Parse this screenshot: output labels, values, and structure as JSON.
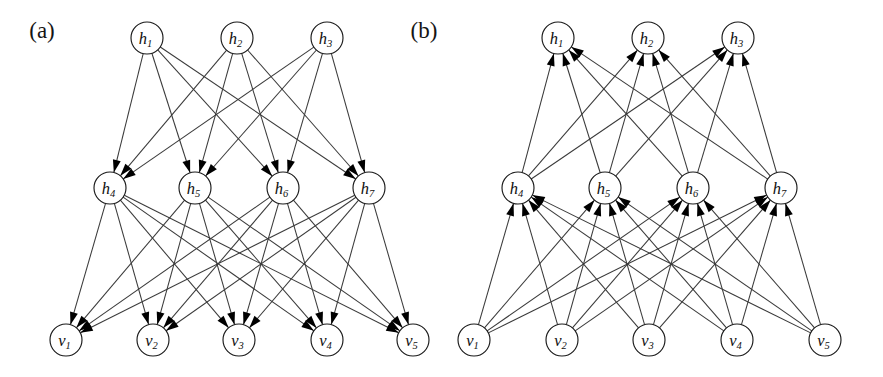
{
  "figure": {
    "width": 883,
    "height": 377,
    "background": "#ffffff",
    "edge_color": "#3a3a3a",
    "node_stroke": "#1a1a1a",
    "node_fill": "#ffffff",
    "arrow_color": "#000000",
    "node_radius": 16
  },
  "panels": [
    {
      "id": "panel-a",
      "label": "(a)",
      "label_x": 42,
      "label_y": 38,
      "direction": "downward",
      "layers": [
        {
          "name": "top-hidden",
          "y": 38,
          "nodes": [
            {
              "id": "h1",
              "base": "h",
              "sub": "1",
              "x": 147
            },
            {
              "id": "h2",
              "base": "h",
              "sub": "2",
              "x": 237
            },
            {
              "id": "h3",
              "base": "h",
              "sub": "3",
              "x": 327
            }
          ]
        },
        {
          "name": "mid-hidden",
          "y": 188,
          "nodes": [
            {
              "id": "h4",
              "base": "h",
              "sub": "4",
              "x": 110
            },
            {
              "id": "h5",
              "base": "h",
              "sub": "5",
              "x": 195
            },
            {
              "id": "h6",
              "base": "h",
              "sub": "6",
              "x": 283
            },
            {
              "id": "h7",
              "base": "h",
              "sub": "7",
              "x": 369
            }
          ]
        },
        {
          "name": "visible",
          "y": 340,
          "nodes": [
            {
              "id": "v1",
              "base": "v",
              "sub": "1",
              "x": 66
            },
            {
              "id": "v2",
              "base": "v",
              "sub": "2",
              "x": 153
            },
            {
              "id": "v3",
              "base": "v",
              "sub": "3",
              "x": 239
            },
            {
              "id": "v4",
              "base": "v",
              "sub": "4",
              "x": 327
            },
            {
              "id": "v5",
              "base": "v",
              "sub": "5",
              "x": 413
            }
          ]
        }
      ],
      "edges": [
        {
          "from": "h1",
          "to": "h4"
        },
        {
          "from": "h1",
          "to": "h5"
        },
        {
          "from": "h1",
          "to": "h6"
        },
        {
          "from": "h1",
          "to": "h7"
        },
        {
          "from": "h2",
          "to": "h4"
        },
        {
          "from": "h2",
          "to": "h5"
        },
        {
          "from": "h2",
          "to": "h6"
        },
        {
          "from": "h2",
          "to": "h7"
        },
        {
          "from": "h3",
          "to": "h4"
        },
        {
          "from": "h3",
          "to": "h5"
        },
        {
          "from": "h3",
          "to": "h6"
        },
        {
          "from": "h3",
          "to": "h7"
        },
        {
          "from": "h4",
          "to": "v1"
        },
        {
          "from": "h4",
          "to": "v2"
        },
        {
          "from": "h4",
          "to": "v3"
        },
        {
          "from": "h4",
          "to": "v4"
        },
        {
          "from": "h4",
          "to": "v5"
        },
        {
          "from": "h5",
          "to": "v1"
        },
        {
          "from": "h5",
          "to": "v2"
        },
        {
          "from": "h5",
          "to": "v3"
        },
        {
          "from": "h5",
          "to": "v4"
        },
        {
          "from": "h5",
          "to": "v5"
        },
        {
          "from": "h6",
          "to": "v1"
        },
        {
          "from": "h6",
          "to": "v2"
        },
        {
          "from": "h6",
          "to": "v3"
        },
        {
          "from": "h6",
          "to": "v4"
        },
        {
          "from": "h6",
          "to": "v5"
        },
        {
          "from": "h7",
          "to": "v1"
        },
        {
          "from": "h7",
          "to": "v2"
        },
        {
          "from": "h7",
          "to": "v3"
        },
        {
          "from": "h7",
          "to": "v4"
        },
        {
          "from": "h7",
          "to": "v5"
        }
      ]
    },
    {
      "id": "panel-b",
      "label": "(b)",
      "label_x": 424,
      "label_y": 38,
      "direction": "upward",
      "layers": [
        {
          "name": "top-hidden",
          "y": 38,
          "nodes": [
            {
              "id": "h1",
              "base": "h",
              "sub": "1",
              "x": 558
            },
            {
              "id": "h2",
              "base": "h",
              "sub": "2",
              "x": 648
            },
            {
              "id": "h3",
              "base": "h",
              "sub": "3",
              "x": 738
            }
          ]
        },
        {
          "name": "mid-hidden",
          "y": 188,
          "nodes": [
            {
              "id": "h4",
              "base": "h",
              "sub": "4",
              "x": 518
            },
            {
              "id": "h5",
              "base": "h",
              "sub": "5",
              "x": 605
            },
            {
              "id": "h6",
              "base": "h",
              "sub": "6",
              "x": 693
            },
            {
              "id": "h7",
              "base": "h",
              "sub": "7",
              "x": 781
            }
          ]
        },
        {
          "name": "visible",
          "y": 340,
          "nodes": [
            {
              "id": "v1",
              "base": "v",
              "sub": "1",
              "x": 474
            },
            {
              "id": "v2",
              "base": "v",
              "sub": "2",
              "x": 562
            },
            {
              "id": "v3",
              "base": "v",
              "sub": "3",
              "x": 649
            },
            {
              "id": "v4",
              "base": "v",
              "sub": "4",
              "x": 737
            },
            {
              "id": "v5",
              "base": "v",
              "sub": "5",
              "x": 825
            }
          ]
        }
      ],
      "edges": [
        {
          "from": "v1",
          "to": "h4"
        },
        {
          "from": "v1",
          "to": "h5"
        },
        {
          "from": "v1",
          "to": "h6"
        },
        {
          "from": "v1",
          "to": "h7"
        },
        {
          "from": "v2",
          "to": "h4"
        },
        {
          "from": "v2",
          "to": "h5"
        },
        {
          "from": "v2",
          "to": "h6"
        },
        {
          "from": "v2",
          "to": "h7"
        },
        {
          "from": "v3",
          "to": "h4"
        },
        {
          "from": "v3",
          "to": "h5"
        },
        {
          "from": "v3",
          "to": "h6"
        },
        {
          "from": "v3",
          "to": "h7"
        },
        {
          "from": "v4",
          "to": "h4"
        },
        {
          "from": "v4",
          "to": "h5"
        },
        {
          "from": "v4",
          "to": "h6"
        },
        {
          "from": "v4",
          "to": "h7"
        },
        {
          "from": "v5",
          "to": "h4"
        },
        {
          "from": "v5",
          "to": "h5"
        },
        {
          "from": "v5",
          "to": "h6"
        },
        {
          "from": "v5",
          "to": "h7"
        },
        {
          "from": "h4",
          "to": "h1"
        },
        {
          "from": "h4",
          "to": "h2"
        },
        {
          "from": "h4",
          "to": "h3"
        },
        {
          "from": "h5",
          "to": "h1"
        },
        {
          "from": "h5",
          "to": "h2"
        },
        {
          "from": "h5",
          "to": "h3"
        },
        {
          "from": "h6",
          "to": "h1"
        },
        {
          "from": "h6",
          "to": "h2"
        },
        {
          "from": "h6",
          "to": "h3"
        },
        {
          "from": "h7",
          "to": "h1"
        },
        {
          "from": "h7",
          "to": "h2"
        },
        {
          "from": "h7",
          "to": "h3"
        }
      ]
    }
  ]
}
